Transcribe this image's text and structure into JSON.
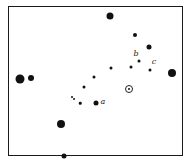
{
  "chart": {
    "frame": {
      "left": 8,
      "top": 6,
      "right": 183,
      "bottom": 156
    },
    "stars": [
      {
        "x": 110,
        "y": 16,
        "size": 7
      },
      {
        "x": 135,
        "y": 35,
        "size": 4
      },
      {
        "x": 149,
        "y": 47,
        "size": 5
      },
      {
        "x": 139,
        "y": 61,
        "size": 3
      },
      {
        "x": 111,
        "y": 68,
        "size": 3
      },
      {
        "x": 131,
        "y": 67,
        "size": 3
      },
      {
        "x": 150,
        "y": 70,
        "size": 3
      },
      {
        "x": 172,
        "y": 73,
        "size": 8
      },
      {
        "x": 20,
        "y": 79,
        "size": 9
      },
      {
        "x": 31,
        "y": 78,
        "size": 6
      },
      {
        "x": 94,
        "y": 77,
        "size": 3
      },
      {
        "x": 84,
        "y": 87,
        "size": 3
      },
      {
        "x": 72,
        "y": 97,
        "size": 2
      },
      {
        "x": 74,
        "y": 99,
        "size": 2
      },
      {
        "x": 80,
        "y": 103,
        "size": 2.5
      },
      {
        "x": 96,
        "y": 103,
        "size": 5
      },
      {
        "x": 61,
        "y": 124,
        "size": 8
      },
      {
        "x": 64,
        "y": 156,
        "size": 5
      }
    ],
    "sun": {
      "x": 129,
      "y": 89,
      "symbol": "☉"
    },
    "labels": [
      {
        "text": "a",
        "x": 103,
        "y": 102
      },
      {
        "text": "b",
        "x": 136,
        "y": 54
      },
      {
        "text": "c",
        "x": 154,
        "y": 62
      }
    ]
  }
}
